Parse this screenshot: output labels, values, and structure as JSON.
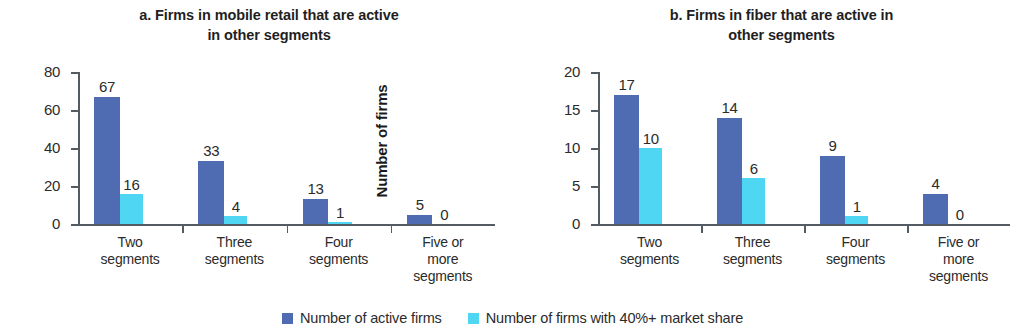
{
  "figure": {
    "background": "#ffffff",
    "primary_color": "#4f6cb3",
    "secondary_color": "#4fd6f2"
  },
  "legend": {
    "items": [
      {
        "label": "Number of active firms",
        "color": "#4f6cb3",
        "swatch": "legend-swatch-primary"
      },
      {
        "label": "Number of firms with 40%+ market share",
        "color": "#4fd6f2",
        "swatch": "legend-swatch-secondary"
      }
    ]
  },
  "chart_data": [
    {
      "type": "bar",
      "panel": "a",
      "title": "a. Firms in mobile retail that are active in other segments",
      "title_line1": "a. Firms in mobile retail that are active",
      "title_line2": "in other segments",
      "xlabel": "",
      "ylabel": "Number of firms",
      "ylim": [
        0,
        80
      ],
      "yticks": [
        0,
        20,
        40,
        60,
        80
      ],
      "ytick_labels": [
        "0",
        "20",
        "40",
        "60",
        "80"
      ],
      "grid": false,
      "legend_position": "bottom-center",
      "categories": [
        "Two segments",
        "Three segments",
        "Four segments",
        "Five or more segments"
      ],
      "category_lines": [
        [
          "Two",
          "segments"
        ],
        [
          "Three",
          "segments"
        ],
        [
          "Four",
          "segments"
        ],
        [
          "Five or",
          "more",
          "segments"
        ]
      ],
      "series": [
        {
          "name": "Number of active firms",
          "color": "#4f6cb3",
          "values": [
            67,
            33,
            13,
            5
          ],
          "value_labels": [
            "67",
            "33",
            "13",
            "5"
          ]
        },
        {
          "name": "Number of firms with 40%+ market share",
          "color": "#4fd6f2",
          "values": [
            16,
            4,
            1,
            0
          ],
          "value_labels": [
            "16",
            "4",
            "1",
            "0"
          ]
        }
      ]
    },
    {
      "type": "bar",
      "panel": "b",
      "title": "b. Firms in fiber that are active in other segments",
      "title_line1": "b. Firms in fiber that are active in",
      "title_line2": "other segments",
      "xlabel": "",
      "ylabel": "Number of firms",
      "ylim": [
        0,
        20
      ],
      "yticks": [
        0,
        5,
        10,
        15,
        20
      ],
      "ytick_labels": [
        "0",
        "5",
        "10",
        "15",
        "20"
      ],
      "grid": false,
      "legend_position": "bottom-center",
      "categories": [
        "Two segments",
        "Three segments",
        "Four segments",
        "Five or more segments"
      ],
      "category_lines": [
        [
          "Two",
          "segments"
        ],
        [
          "Three",
          "segments"
        ],
        [
          "Four",
          "segments"
        ],
        [
          "Five or",
          "more",
          "segments"
        ]
      ],
      "series": [
        {
          "name": "Number of active firms",
          "color": "#4f6cb3",
          "values": [
            17,
            14,
            9,
            4
          ],
          "value_labels": [
            "17",
            "14",
            "9",
            "4"
          ]
        },
        {
          "name": "Number of firms with 40%+ market share",
          "color": "#4fd6f2",
          "values": [
            10,
            6,
            1,
            0
          ],
          "value_labels": [
            "10",
            "6",
            "1",
            "0"
          ]
        }
      ]
    }
  ]
}
